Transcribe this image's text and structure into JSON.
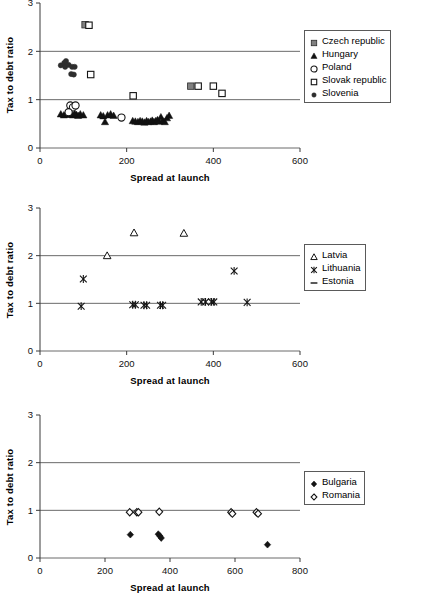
{
  "figure": {
    "panel_count": 3
  },
  "chart_data": [
    {
      "id": "panel-1",
      "type": "scatter",
      "title": "",
      "xlabel": "Spread at launch",
      "ylabel": "Tax to debt ratio",
      "xlim": [
        0,
        600
      ],
      "ylim": [
        0,
        3
      ],
      "xticks": [
        0,
        200,
        400,
        600
      ],
      "yticks": [
        0,
        1,
        2,
        3
      ],
      "grid": "horizontal-at-y-1-and-2",
      "legend_position": "right",
      "series": [
        {
          "name": "Czech republic",
          "marker": "filled-square",
          "color": "#808080",
          "points": [
            [
              104,
              2.55
            ],
            [
              348,
              1.28
            ]
          ]
        },
        {
          "name": "Hungary",
          "marker": "filled-triangle",
          "color": "#111111",
          "points": [
            [
              48,
              0.7
            ],
            [
              55,
              0.68
            ],
            [
              60,
              0.7
            ],
            [
              64,
              0.69
            ],
            [
              68,
              0.72
            ],
            [
              72,
              0.7
            ],
            [
              76,
              0.68
            ],
            [
              80,
              0.71
            ],
            [
              84,
              0.69
            ],
            [
              88,
              0.67
            ],
            [
              93,
              0.7
            ],
            [
              100,
              0.68
            ],
            [
              140,
              0.68
            ],
            [
              146,
              0.66
            ],
            [
              150,
              0.54
            ],
            [
              156,
              0.68
            ],
            [
              163,
              0.7
            ],
            [
              170,
              0.67
            ],
            [
              214,
              0.56
            ],
            [
              220,
              0.55
            ],
            [
              226,
              0.54
            ],
            [
              231,
              0.56
            ],
            [
              236,
              0.55
            ],
            [
              241,
              0.53
            ],
            [
              246,
              0.56
            ],
            [
              250,
              0.54
            ],
            [
              255,
              0.55
            ],
            [
              259,
              0.57
            ],
            [
              263,
              0.54
            ],
            [
              267,
              0.56
            ],
            [
              271,
              0.58
            ],
            [
              275,
              0.55
            ],
            [
              279,
              0.64
            ],
            [
              283,
              0.56
            ],
            [
              288,
              0.54
            ],
            [
              293,
              0.62
            ],
            [
              298,
              0.67
            ]
          ]
        },
        {
          "name": "Poland",
          "marker": "open-circle",
          "color": "#141414",
          "points": [
            [
              70,
              0.88
            ],
            [
              76,
              0.84
            ],
            [
              82,
              0.88
            ],
            [
              66,
              0.74
            ],
            [
              188,
              0.63
            ]
          ]
        },
        {
          "name": "Slovak republic",
          "marker": "open-square",
          "color": "#141414",
          "points": [
            [
              113,
              2.54
            ],
            [
              117,
              1.52
            ],
            [
              215,
              1.08
            ],
            [
              365,
              1.28
            ],
            [
              400,
              1.28
            ],
            [
              420,
              1.13
            ]
          ]
        },
        {
          "name": "Slovenia",
          "marker": "filled-circle",
          "color": "#2e2e2e",
          "points": [
            [
              48,
              1.71
            ],
            [
              56,
              1.76
            ],
            [
              58,
              1.68
            ],
            [
              60,
              1.8
            ],
            [
              66,
              1.72
            ],
            [
              74,
              1.68
            ],
            [
              80,
              1.68
            ],
            [
              72,
              1.53
            ],
            [
              78,
              1.52
            ]
          ]
        }
      ]
    },
    {
      "id": "panel-2",
      "type": "scatter",
      "title": "",
      "xlabel": "Spread at launch",
      "ylabel": "Tax to debt ratio",
      "xlim": [
        0,
        600
      ],
      "ylim": [
        0,
        3
      ],
      "xticks": [
        0,
        200,
        400,
        600
      ],
      "yticks": [
        0,
        1,
        2,
        3
      ],
      "grid": "horizontal-at-y-1-and-2",
      "legend_position": "right",
      "series": [
        {
          "name": "Latvia",
          "marker": "open-triangle",
          "color": "#141414",
          "points": [
            [
              155,
              2.0
            ],
            [
              217,
              2.48
            ],
            [
              332,
              2.47
            ]
          ]
        },
        {
          "name": "Lithuania",
          "marker": "asterisk",
          "color": "#141414",
          "points": [
            [
              100,
              1.51
            ],
            [
              95,
              0.94
            ],
            [
              214,
              0.97
            ],
            [
              220,
              0.97
            ],
            [
              240,
              0.96
            ],
            [
              246,
              0.96
            ],
            [
              278,
              0.96
            ],
            [
              283,
              0.96
            ],
            [
              372,
              1.03
            ],
            [
              382,
              1.03
            ],
            [
              396,
              1.03
            ],
            [
              401,
              1.03
            ],
            [
              448,
              1.68
            ],
            [
              478,
              1.02
            ]
          ]
        },
        {
          "name": "Estonia",
          "marker": "dash",
          "color": "#141414",
          "points": []
        }
      ]
    },
    {
      "id": "panel-3",
      "type": "scatter",
      "title": "",
      "xlabel": "Spread at launch",
      "ylabel": "Tax to debt ratio",
      "xlim": [
        0,
        800
      ],
      "ylim": [
        0,
        3
      ],
      "xticks": [
        0,
        200,
        400,
        600,
        800
      ],
      "yticks": [
        0,
        1,
        2,
        3
      ],
      "grid": "horizontal-at-y-1-and-2",
      "legend_position": "right",
      "series": [
        {
          "name": "Bulgaria",
          "marker": "filled-diamond",
          "color": "#141414",
          "points": [
            [
              278,
              0.49
            ],
            [
              364,
              0.5
            ],
            [
              369,
              0.46
            ],
            [
              373,
              0.42
            ],
            [
              700,
              0.28
            ]
          ]
        },
        {
          "name": "Romania",
          "marker": "open-diamond",
          "color": "#141414",
          "points": [
            [
              276,
              0.96
            ],
            [
              298,
              0.96
            ],
            [
              303,
              0.96
            ],
            [
              367,
              0.97
            ],
            [
              588,
              0.96
            ],
            [
              592,
              0.93
            ],
            [
              666,
              0.96
            ],
            [
              671,
              0.93
            ]
          ]
        }
      ]
    }
  ]
}
